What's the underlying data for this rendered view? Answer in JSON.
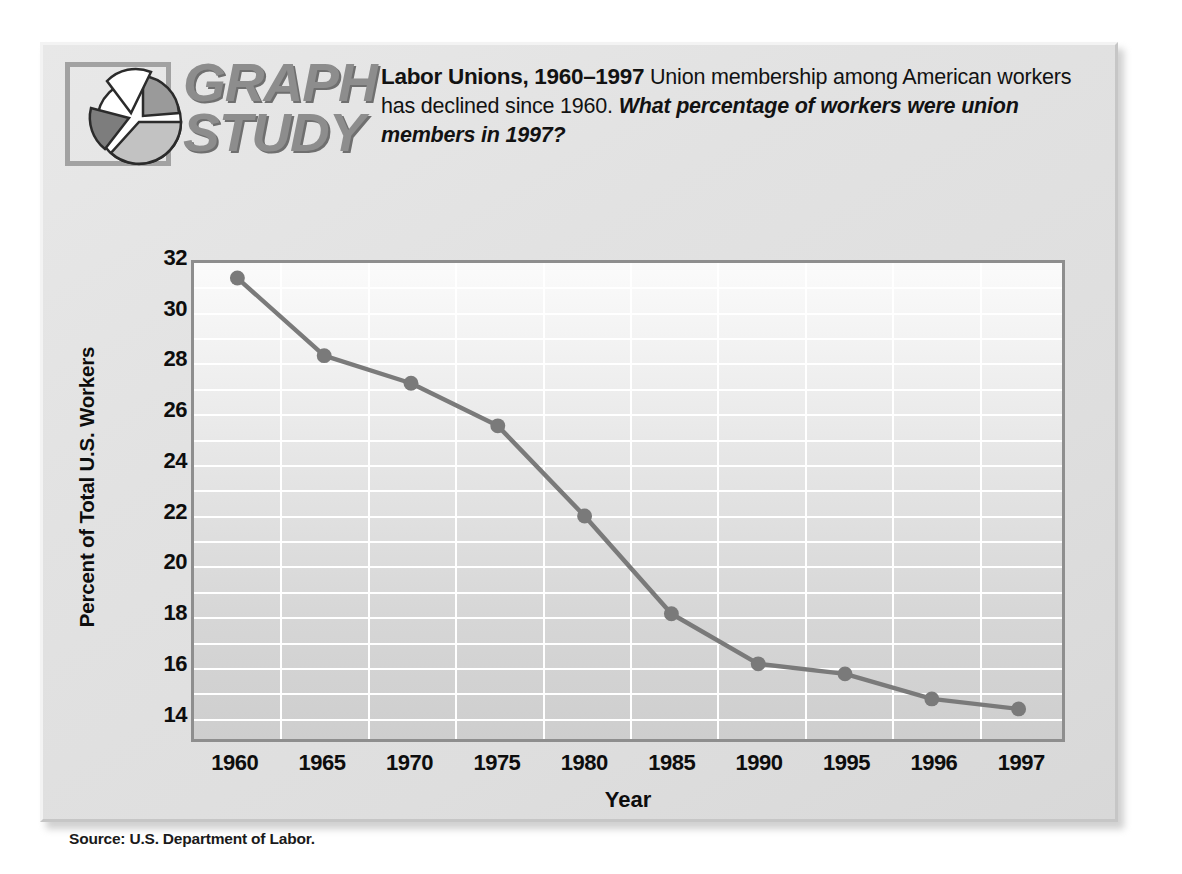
{
  "logo": {
    "wordmark_line1": "GRAPH",
    "wordmark_line2": "STUDY",
    "icon_name": "pie-chart-logo",
    "colors": {
      "frame": "#a2a2a2",
      "wedge_white": "#ffffff",
      "wedge_dark": "#7d7d7d",
      "wedge_mid": "#9a9a9a",
      "wedge_light": "#c2c2c2"
    }
  },
  "header": {
    "title": "Labor Unions, 1960–1997",
    "description": "Union membership among American workers has declined since 1960.",
    "question": "What percentage of workers were union members in 1997?"
  },
  "source": "Source: U.S. Department of Labor.",
  "colors": {
    "line": "#7a7a7a",
    "marker": "#7a7a7a",
    "gridline": "#ffffff",
    "plot_border": "#8e8e8e",
    "card_background": "#e4e4e4",
    "text": "#0d0d0d"
  },
  "chart_data": {
    "type": "line",
    "title": "Labor Unions, 1960–1997",
    "xlabel": "Year",
    "ylabel": "Percent of Total U.S. Workers",
    "categories": [
      "1960",
      "1965",
      "1970",
      "1975",
      "1980",
      "1985",
      "1990",
      "1995",
      "1996",
      "1997"
    ],
    "values": [
      31.4,
      28.3,
      27.2,
      25.5,
      21.9,
      18.0,
      16.0,
      15.6,
      14.6,
      14.2
    ],
    "series": [
      {
        "name": "Percent of Total U.S. Workers",
        "values": [
          31.4,
          28.3,
          27.2,
          25.5,
          21.9,
          18.0,
          16.0,
          15.6,
          14.6,
          14.2
        ]
      }
    ],
    "ylim": [
      13,
      32
    ],
    "ytick_labels": [
      "32",
      "30",
      "28",
      "26",
      "24",
      "22",
      "20",
      "18",
      "16",
      "14"
    ],
    "ytick_values": [
      32,
      30,
      28,
      26,
      24,
      22,
      20,
      18,
      16,
      14
    ],
    "minor_gridline_step": 1,
    "grid": true,
    "legend": "none"
  }
}
